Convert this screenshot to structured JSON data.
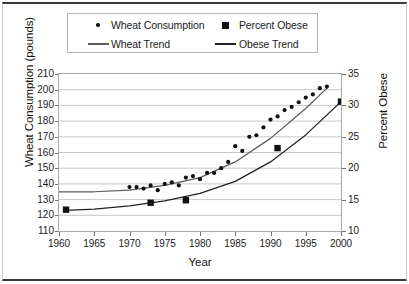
{
  "figure": {
    "xlabel": "Year",
    "ylabel_left": "Wheat Consumption (pounds)",
    "ylabel_right": "Percent Obese"
  },
  "legend": {
    "items": [
      {
        "label": "Wheat Consumption",
        "marker": "dot-marker",
        "color": "#111111"
      },
      {
        "label": "Percent Obese",
        "marker": "square-marker",
        "color": "#111111"
      },
      {
        "label": "Wheat Trend",
        "marker": "line-marker-light",
        "color": "#5b5b5b"
      },
      {
        "label": "Obese Trend",
        "marker": "line-marker-dark",
        "color": "#222222"
      }
    ]
  },
  "chart_data": {
    "type": "scatter",
    "title": "",
    "xlabel": "Year",
    "xlim": [
      1960,
      2000
    ],
    "xticks": [
      1960,
      1965,
      1970,
      1975,
      1980,
      1985,
      1990,
      1995,
      2000
    ],
    "grid": true,
    "legend_position": "top",
    "axes": [
      {
        "id": "left",
        "label": "Wheat Consumption (pounds)",
        "lim": [
          110,
          210
        ],
        "ticks": [
          110,
          120,
          130,
          140,
          150,
          160,
          170,
          180,
          190,
          200,
          210
        ]
      },
      {
        "id": "right",
        "label": "Percent Obese",
        "lim": [
          10,
          35
        ],
        "ticks": [
          10,
          15,
          20,
          25,
          30,
          35
        ]
      }
    ],
    "series": [
      {
        "name": "Wheat Consumption",
        "axis": "left",
        "style": "dots",
        "marker": "circle",
        "color": "#111111",
        "points": [
          {
            "x": 1970,
            "y": 138
          },
          {
            "x": 1971,
            "y": 138
          },
          {
            "x": 1972,
            "y": 137
          },
          {
            "x": 1973,
            "y": 139
          },
          {
            "x": 1974,
            "y": 136
          },
          {
            "x": 1975,
            "y": 140
          },
          {
            "x": 1976,
            "y": 141
          },
          {
            "x": 1977,
            "y": 139
          },
          {
            "x": 1978,
            "y": 144
          },
          {
            "x": 1979,
            "y": 145
          },
          {
            "x": 1980,
            "y": 143
          },
          {
            "x": 1981,
            "y": 147
          },
          {
            "x": 1982,
            "y": 147
          },
          {
            "x": 1983,
            "y": 150
          },
          {
            "x": 1984,
            "y": 154
          },
          {
            "x": 1985,
            "y": 164
          },
          {
            "x": 1986,
            "y": 161
          },
          {
            "x": 1987,
            "y": 170
          },
          {
            "x": 1988,
            "y": 171
          },
          {
            "x": 1989,
            "y": 176
          },
          {
            "x": 1990,
            "y": 181
          },
          {
            "x": 1991,
            "y": 183
          },
          {
            "x": 1992,
            "y": 187
          },
          {
            "x": 1993,
            "y": 189
          },
          {
            "x": 1994,
            "y": 192
          },
          {
            "x": 1995,
            "y": 195
          },
          {
            "x": 1996,
            "y": 197
          },
          {
            "x": 1997,
            "y": 201
          },
          {
            "x": 1998,
            "y": 202
          }
        ]
      },
      {
        "name": "Percent Obese",
        "axis": "right",
        "style": "squares",
        "marker": "square",
        "color": "#111111",
        "points": [
          {
            "x": 1961,
            "y": 13.4
          },
          {
            "x": 1973,
            "y": 14.5
          },
          {
            "x": 1978,
            "y": 14.9
          },
          {
            "x": 1991,
            "y": 23.2
          },
          {
            "x": 2000,
            "y": 30.6
          }
        ]
      },
      {
        "name": "Wheat Trend",
        "axis": "left",
        "style": "line",
        "color": "#5b5b5b",
        "points": [
          {
            "x": 1960,
            "y": 135
          },
          {
            "x": 1965,
            "y": 135
          },
          {
            "x": 1970,
            "y": 136
          },
          {
            "x": 1975,
            "y": 139
          },
          {
            "x": 1980,
            "y": 144
          },
          {
            "x": 1985,
            "y": 154
          },
          {
            "x": 1990,
            "y": 169
          },
          {
            "x": 1995,
            "y": 188
          },
          {
            "x": 1998,
            "y": 201
          }
        ]
      },
      {
        "name": "Obese Trend",
        "axis": "right",
        "style": "line",
        "color": "#222222",
        "points": [
          {
            "x": 1961,
            "y": 13.3
          },
          {
            "x": 1965,
            "y": 13.5
          },
          {
            "x": 1970,
            "y": 14.0
          },
          {
            "x": 1975,
            "y": 14.8
          },
          {
            "x": 1980,
            "y": 16.0
          },
          {
            "x": 1985,
            "y": 17.9
          },
          {
            "x": 1990,
            "y": 21.0
          },
          {
            "x": 1995,
            "y": 25.3
          },
          {
            "x": 2000,
            "y": 30.6
          }
        ]
      }
    ]
  }
}
